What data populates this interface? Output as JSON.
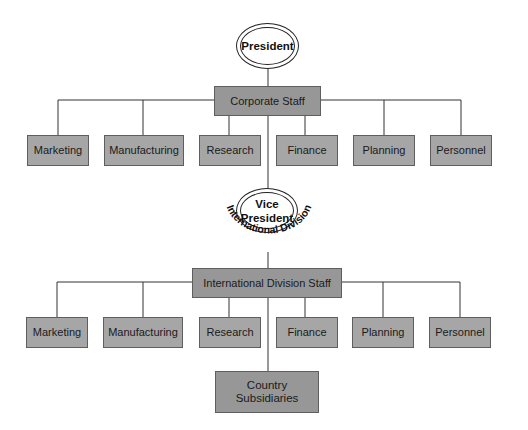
{
  "president": {
    "label": "President"
  },
  "corporate_staff": {
    "label": "Corporate Staff",
    "departments": [
      "Marketing",
      "Manufacturing",
      "Research",
      "Finance",
      "Planning",
      "Personnel"
    ]
  },
  "vice_president": {
    "label_line1": "Vice",
    "label_line2": "President",
    "arc_label": "International Division"
  },
  "international_staff": {
    "label": "International Division Staff",
    "departments": [
      "Marketing",
      "Manufacturing",
      "Research",
      "Finance",
      "Planning",
      "Personnel"
    ]
  },
  "country_subsidiaries": {
    "label_line1": "Country",
    "label_line2": "Subsidiaries"
  },
  "colors": {
    "box_fill": "#a6a6a6",
    "staff_fill": "#979797",
    "border": "#5e5e5e",
    "line": "#333333"
  }
}
